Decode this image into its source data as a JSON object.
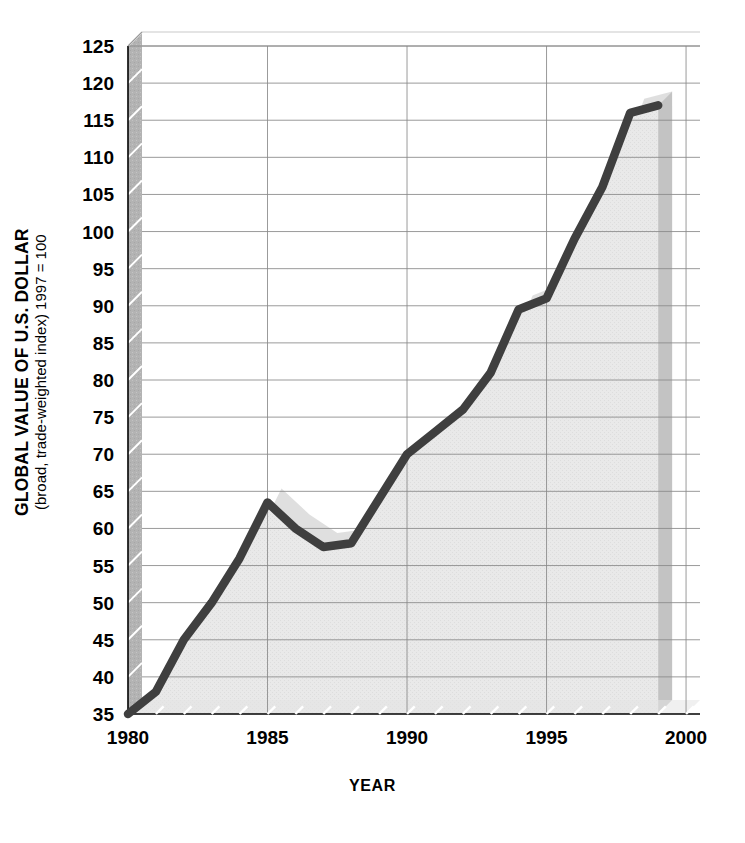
{
  "chart_data": {
    "type": "area",
    "title": "",
    "xlabel": "YEAR",
    "ylabel": "GLOBAL VALUE OF U.S. DOLLAR",
    "ylabel_sub": "(broad, trade-weighted index) 1997 = 100",
    "xlim": [
      1980,
      2000.5
    ],
    "ylim": [
      35,
      125
    ],
    "grid": true,
    "legend": "none",
    "y_ticks": [
      35,
      40,
      45,
      50,
      55,
      60,
      65,
      70,
      75,
      80,
      85,
      90,
      95,
      100,
      105,
      110,
      115,
      120,
      125
    ],
    "x_ticks": [
      1980,
      1985,
      1990,
      1995,
      2000
    ],
    "x_minor_step": 1,
    "series": [
      {
        "name": "Global value of U.S. dollar",
        "x": [
          1980,
          1981,
          1982,
          1983,
          1984,
          1985,
          1986,
          1987,
          1988,
          1989,
          1990,
          1991,
          1992,
          1993,
          1994,
          1995,
          1996,
          1997,
          1998,
          1999
        ],
        "values": [
          35,
          38,
          45,
          50,
          56,
          63.5,
          60,
          57.5,
          58,
          64,
          70,
          73,
          76,
          81,
          89.5,
          91,
          99,
          106,
          116,
          117
        ]
      }
    ],
    "colors": {
      "line": "#3f3f3f",
      "area_fill": "#e9e9e9",
      "grid": "#8a8a8a",
      "wall_left": "#b3b3b3",
      "wall_right": "#b8b8b8",
      "shadow": "#d4d4d4",
      "background": "#ffffff",
      "text": "#000000"
    }
  },
  "axes": {
    "y_title_main": "GLOBAL VALUE OF U.S. DOLLAR",
    "y_title_sub": "(broad, trade-weighted index) 1997 = 100",
    "x_title": "YEAR",
    "y_tick_labels": [
      "125",
      "120",
      "115",
      "110",
      "105",
      "100",
      "95",
      "90",
      "85",
      "80",
      "75",
      "70",
      "65",
      "60",
      "55",
      "50",
      "45",
      "40",
      "35"
    ],
    "x_tick_labels": [
      "1980",
      "1985",
      "1990",
      "1995",
      "2000"
    ]
  }
}
